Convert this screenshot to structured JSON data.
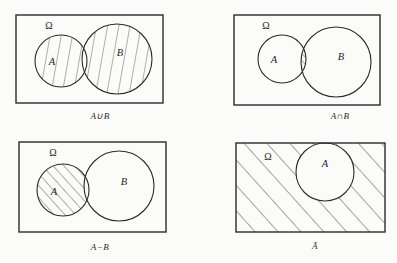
{
  "figure": {
    "background_color": "#fbfbfa",
    "stroke_color": "#2b2b2b",
    "hatch_color": "#3a3a3a",
    "panel_count": 4
  },
  "panels": [
    {
      "id": "union",
      "position": "top-left",
      "caption": "A∪B",
      "universe_label": "Ω",
      "set_labels": [
        "A",
        "B"
      ],
      "shaded_region": "A union B",
      "hatch_style": "near-vertical",
      "rect": {
        "x": 16,
        "y": 15,
        "w": 147,
        "h": 88
      },
      "circles": [
        {
          "label": "A",
          "cx": 61,
          "cy": 61,
          "r": 26
        },
        {
          "label": "B",
          "cx": 117,
          "cy": 59,
          "r": 35
        }
      ]
    },
    {
      "id": "intersection",
      "position": "top-right",
      "caption": "A∩B",
      "universe_label": "Ω",
      "set_labels": [
        "A",
        "B"
      ],
      "shaded_region": "A intersect B",
      "hatch_style": "diagonal",
      "rect": {
        "x": 234,
        "y": 15,
        "w": 146,
        "h": 90
      },
      "circles": [
        {
          "label": "A",
          "cx": 282,
          "cy": 59,
          "r": 24
        },
        {
          "label": "B",
          "cx": 336,
          "cy": 62,
          "r": 35
        }
      ]
    },
    {
      "id": "difference",
      "position": "bottom-left",
      "caption": "A−B",
      "universe_label": "Ω",
      "set_labels": [
        "A",
        "B"
      ],
      "shaded_region": "A minus B",
      "hatch_style": "diagonal",
      "rect": {
        "x": 19,
        "y": 142,
        "w": 147,
        "h": 90
      },
      "circles": [
        {
          "label": "A",
          "cx": 63,
          "cy": 190,
          "r": 26
        },
        {
          "label": "B",
          "cx": 119,
          "cy": 186,
          "r": 35
        }
      ]
    },
    {
      "id": "complement",
      "position": "bottom-right",
      "caption": "Ā",
      "universe_label": "Ω",
      "set_labels": [
        "A"
      ],
      "shaded_region": "complement of A",
      "hatch_style": "diagonal",
      "rect": {
        "x": 236,
        "y": 143,
        "w": 149,
        "h": 89
      },
      "circles": [
        {
          "label": "A",
          "cx": 325,
          "cy": 172,
          "r": 29
        }
      ]
    }
  ]
}
